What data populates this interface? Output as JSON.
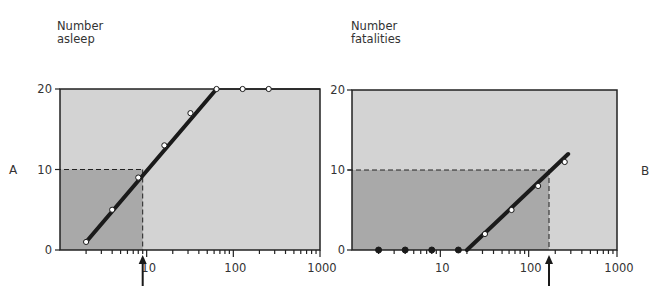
{
  "chart_data": [
    {
      "type": "line",
      "panel": "A",
      "title": "",
      "ylabel": "Number asleep",
      "ylabel_lines": [
        "Number",
        "asleep"
      ],
      "xlabel": "",
      "xscale": "log",
      "xlim": [
        1,
        1000
      ],
      "ylim": [
        0,
        20
      ],
      "xticks": [
        10,
        100,
        1000
      ],
      "xtick_labels": [
        "10",
        "100",
        "1000"
      ],
      "yticks": [
        0,
        10,
        20
      ],
      "ytick_labels": [
        "0",
        "10",
        "20"
      ],
      "grid": false,
      "series": [
        {
          "name": "observed",
          "marker": "open-circle",
          "x": [
            2,
            4,
            8,
            16,
            32,
            64,
            128,
            256
          ],
          "y": [
            1,
            5,
            9,
            13,
            17,
            20,
            20,
            20
          ]
        }
      ],
      "fit_line": {
        "x": [
          2,
          64
        ],
        "y": [
          1,
          20
        ]
      },
      "reference": {
        "y": 10,
        "x_at_y": 9,
        "label": "ED50 arrow",
        "shaded_region": "x<=9, y<=10"
      }
    },
    {
      "type": "line",
      "panel": "B",
      "title": "",
      "ylabel": "Number fatalities",
      "ylabel_lines": [
        "Number",
        "fatalities"
      ],
      "xlabel": "",
      "xscale": "log",
      "xlim": [
        1,
        1000
      ],
      "ylim": [
        0,
        20
      ],
      "xticks": [
        10,
        100,
        1000
      ],
      "xtick_labels": [
        "10",
        "100",
        "1000"
      ],
      "yticks": [
        0,
        10,
        20
      ],
      "ytick_labels": [
        "0",
        "10",
        "20"
      ],
      "grid": false,
      "series": [
        {
          "name": "zero fatalities",
          "marker": "filled-circle",
          "x": [
            2,
            4,
            8,
            16
          ],
          "y": [
            0,
            0,
            0,
            0
          ]
        },
        {
          "name": "observed",
          "marker": "open-circle",
          "x": [
            32,
            64,
            128,
            256
          ],
          "y": [
            2,
            5,
            8,
            11
          ]
        }
      ],
      "fit_line": {
        "x": [
          20,
          280
        ],
        "y": [
          0,
          12
        ]
      },
      "reference": {
        "y": 10,
        "x_at_y": 170,
        "label": "LD50 arrow",
        "shaded_region": "x<=170, y<=10"
      }
    }
  ],
  "panels": {
    "A": {
      "letter": "A",
      "ylabel_line1": "Number",
      "ylabel_line2": "asleep"
    },
    "B": {
      "letter": "B",
      "ylabel_line1": "Number",
      "ylabel_line2": "fatalities"
    }
  },
  "colors": {
    "plot_bg": "#d3d3d3",
    "shaded": "#a9a9a9",
    "line": "#1a1a1a",
    "axis": "#222222"
  }
}
